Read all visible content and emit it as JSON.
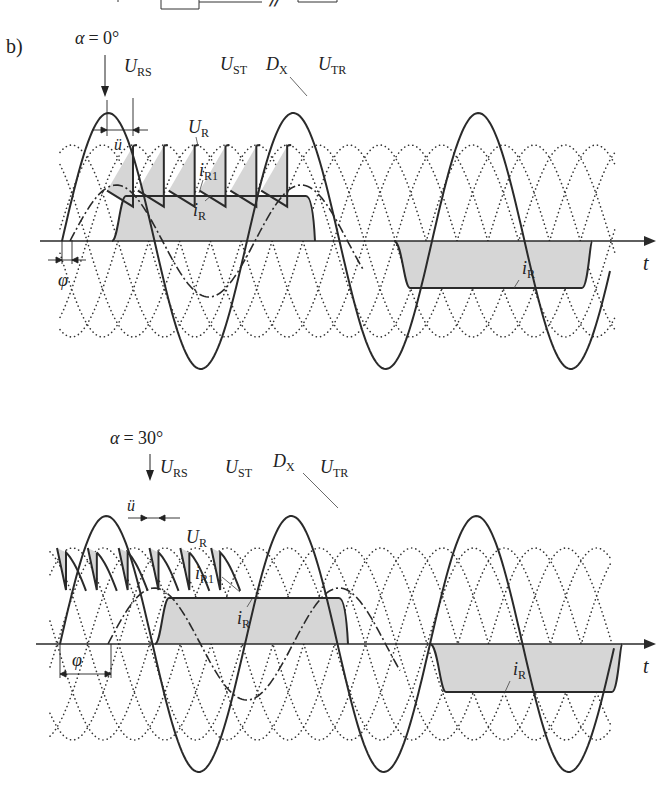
{
  "figure": {
    "part_label": "b)",
    "axis_label": "t",
    "colors": {
      "ink": "#2a2a2a",
      "fill": "#d6d6d6",
      "dots": "#333333"
    }
  },
  "panel_top": {
    "alpha_label": "α = 0°",
    "labels": {
      "U_RS": {
        "main": "U",
        "sub": "RS"
      },
      "U_ST": {
        "main": "U",
        "sub": "ST"
      },
      "D_X": {
        "main": "D",
        "sub": "X"
      },
      "U_TR": {
        "main": "U",
        "sub": "TR"
      },
      "U_R": {
        "main": "U",
        "sub": "R"
      },
      "i_R1": {
        "main": "i",
        "sub": "R1"
      },
      "i_R_pos": {
        "main": "i",
        "sub": "R"
      },
      "i_R_neg": {
        "main": "i",
        "sub": "R"
      },
      "u_overlap": "ü",
      "phi": "φ"
    }
  },
  "panel_bottom": {
    "alpha_label": "α = 30°",
    "labels": {
      "U_RS": {
        "main": "U",
        "sub": "RS"
      },
      "U_ST": {
        "main": "U",
        "sub": "ST"
      },
      "D_X": {
        "main": "D",
        "sub": "X"
      },
      "U_TR": {
        "main": "U",
        "sub": "TR"
      },
      "U_R": {
        "main": "U",
        "sub": "R"
      },
      "i_R1": {
        "main": "i",
        "sub": "R1"
      },
      "i_R_pos": {
        "main": "i",
        "sub": "R"
      },
      "i_R_neg": {
        "main": "i",
        "sub": "R"
      },
      "u_overlap": "ü",
      "phi": "φ"
    }
  }
}
